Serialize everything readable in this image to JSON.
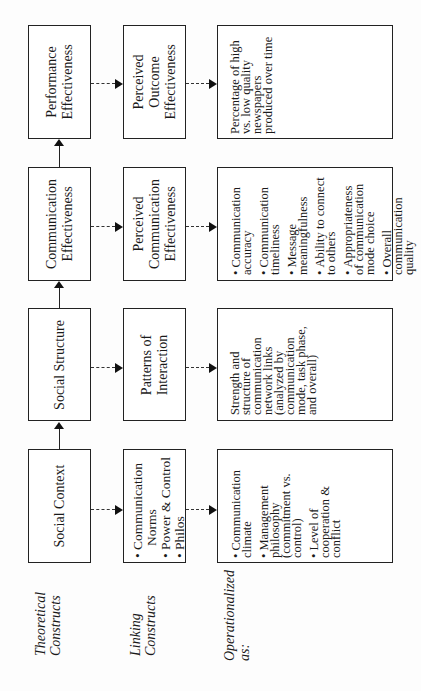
{
  "row_labels": {
    "theoretical": [
      "Theoretical",
      "Constructs"
    ],
    "linking": [
      "Linking",
      "Constructs"
    ],
    "operational": [
      "Operationalized",
      "as:"
    ]
  },
  "columns": [
    {
      "theoretical": [
        "Performance",
        "Effectiveness"
      ],
      "linking": [
        "Perceived",
        "Outcome",
        "Effectiveness"
      ],
      "operational": {
        "type": "text",
        "text": "Percentage of high vs. low quality newspapers produced over time"
      }
    },
    {
      "theoretical": [
        "Communication",
        "Effectiveness"
      ],
      "linking": [
        "Perceived",
        "Communication",
        "Effectiveness"
      ],
      "operational": {
        "type": "list",
        "items": [
          "Communication accuracy",
          "Communication timeliness",
          "Message meaningfulness",
          "Ability to connect to others",
          "Appropriateness of communication mode choice",
          "Overall communication quality"
        ]
      }
    },
    {
      "theoretical": [
        "Social Structure"
      ],
      "linking": [
        "Patterns of",
        "Interaction"
      ],
      "operational": {
        "type": "text",
        "text": "Strength and structure of communication network links (analyzed by communication mode, task phase, and overall)"
      }
    },
    {
      "theoretical": [
        "Social Context"
      ],
      "linking_list": [
        "Communication",
        "Norms",
        "Power & Control",
        "Philos"
      ],
      "operational": {
        "type": "list",
        "items": [
          "Communication climate",
          "Management philosophy (commitment vs. control)",
          "Level of cooperation & conflict"
        ]
      }
    }
  ]
}
